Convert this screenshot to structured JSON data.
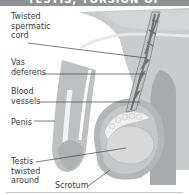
{
  "header": {
    "title": "TESTIS, TORSION OF"
  },
  "diagram": {
    "labels": {
      "spermatic_cord": "Twisted\nspermatic\ncord",
      "vas_deferens": "Vas\ndeferens",
      "blood_vessels": "Blood\nvessels",
      "penis": "Penis",
      "testis": "Testis\ntwisted\naround",
      "scrotum": "Scrotum"
    },
    "colors": {
      "body": "#c9cacc",
      "body_shadow": "#a9abad",
      "scrotum": "#b7b8ba",
      "testis": "#d7d7d8",
      "epididymis": "#eeeeee",
      "vessel_dark": "#6f7174",
      "leader_line": "#444444"
    }
  }
}
